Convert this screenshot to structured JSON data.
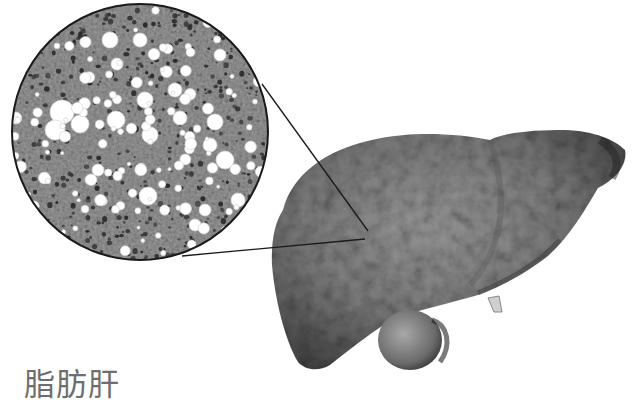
{
  "caption": {
    "text": "脂肪肝"
  },
  "figure": {
    "inset": "magnified histology of liver tissue with lipid vacuoles",
    "colors": {
      "background": "#ffffff",
      "liver_base": "#7a7a7a",
      "liver_light": "#9a9a9a",
      "liver_dark": "#3c3c3c",
      "tissue_base": "#8e8e8e",
      "nucleus": "#2a2a2a",
      "vacuole": "#ffffff",
      "outline": "#1a1a1a",
      "caption": "#6e6e6e"
    }
  }
}
